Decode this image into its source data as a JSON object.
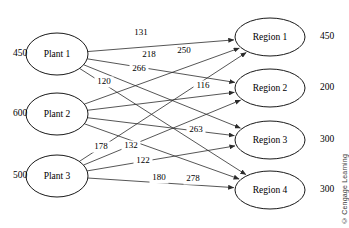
{
  "figure": {
    "type": "transportation-network",
    "credit": "© Cengage Learning"
  },
  "colors": {
    "stroke": "#2b2b2b",
    "node_stroke": "#1a1a1a",
    "background": "#ffffff",
    "text": "#000000"
  },
  "nodes": {
    "sources": [
      {
        "id": "plant1",
        "label": "Plant 1",
        "supply": "450",
        "cx": 57,
        "cy": 54,
        "rx": 31,
        "ry": 21
      },
      {
        "id": "plant2",
        "label": "Plant 2",
        "supply": "600",
        "cx": 57,
        "cy": 114,
        "rx": 31,
        "ry": 21
      },
      {
        "id": "plant3",
        "label": "Plant 3",
        "supply": "500",
        "cx": 57,
        "cy": 176,
        "rx": 31,
        "ry": 21
      }
    ],
    "destinations": [
      {
        "id": "region1",
        "label": "Region 1",
        "demand": "450",
        "cx": 270,
        "cy": 37,
        "rx": 35,
        "ry": 19
      },
      {
        "id": "region2",
        "label": "Region 2",
        "demand": "200",
        "cx": 270,
        "cy": 88,
        "rx": 35,
        "ry": 19
      },
      {
        "id": "region3",
        "label": "Region 3",
        "demand": "300",
        "cx": 270,
        "cy": 140,
        "rx": 35,
        "ry": 19
      },
      {
        "id": "region4",
        "label": "Region 4",
        "demand": "300",
        "cx": 270,
        "cy": 190,
        "rx": 35,
        "ry": 19
      }
    ]
  },
  "arcs": [
    {
      "from": "plant1",
      "to": "region1",
      "cost": "131",
      "lx": 141,
      "ly": 33
    },
    {
      "from": "plant1",
      "to": "region2",
      "cost": "218",
      "lx": 149,
      "ly": 55
    },
    {
      "from": "plant1",
      "to": "region3",
      "cost": "266",
      "lx": 139,
      "ly": 69
    },
    {
      "from": "plant1",
      "to": "region4",
      "cost": "120",
      "lx": 104,
      "ly": 82
    },
    {
      "from": "plant2",
      "to": "region1",
      "cost": "250",
      "lx": 184,
      "ly": 51
    },
    {
      "from": "plant2",
      "to": "region2",
      "cost": "116",
      "lx": 203,
      "ly": 86
    },
    {
      "from": "plant2",
      "to": "region3",
      "cost": "263",
      "lx": 196,
      "ly": 130
    },
    {
      "from": "plant2",
      "to": "region4",
      "cost": "278",
      "lx": 193,
      "ly": 179
    },
    {
      "from": "plant3",
      "to": "region1",
      "cost": "178",
      "lx": 101,
      "ly": 147
    },
    {
      "from": "plant3",
      "to": "region2",
      "cost": "132",
      "lx": 131,
      "ly": 146
    },
    {
      "from": "plant3",
      "to": "region3",
      "cost": "122",
      "lx": 143,
      "ly": 161
    },
    {
      "from": "plant3",
      "to": "region4",
      "cost": "180",
      "lx": 159,
      "ly": 178
    }
  ],
  "supply_label_positions": [
    {
      "x": 20,
      "y": 54
    },
    {
      "x": 20,
      "y": 114
    },
    {
      "x": 20,
      "y": 176
    }
  ],
  "demand_label_positions": [
    {
      "x": 327,
      "y": 37
    },
    {
      "x": 327,
      "y": 88
    },
    {
      "x": 327,
      "y": 140
    },
    {
      "x": 327,
      "y": 190
    }
  ]
}
